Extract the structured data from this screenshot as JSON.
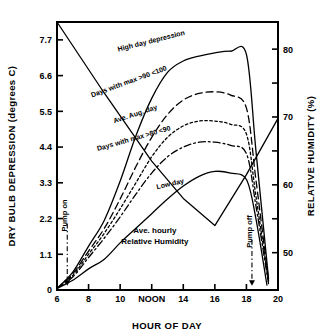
{
  "chart_data": {
    "type": "line",
    "title": "",
    "xlabel": "HOUR OF DAY",
    "ylabel": "DRY BULB DEPRESSION (degrees C)",
    "y2label": "RELATIVE HUMIDITY (%)",
    "xlim": [
      6,
      20
    ],
    "ylim": [
      0,
      8.25
    ],
    "y2lim": [
      44.5,
      84.0
    ],
    "grid": false,
    "legend_position": "inline-curve-labels",
    "xticks": [
      6,
      8,
      10,
      12,
      14,
      16,
      18,
      20
    ],
    "xtick_labels": [
      "6",
      "8",
      "10",
      "NOON",
      "14",
      "16",
      "18",
      "20"
    ],
    "yticks": [
      0,
      1.1,
      2.2,
      3.3,
      4.4,
      5.5,
      6.6,
      7.7
    ],
    "ytick_labels": [
      "0",
      "1.1",
      "2.2",
      "3.3",
      "4.4",
      "5.5",
      "6.6",
      "7.7"
    ],
    "y2ticks": [
      50,
      55,
      60,
      65,
      70,
      75,
      80
    ],
    "y2tick_labels": [
      "50",
      "",
      "60",
      "",
      "70",
      "",
      "80"
    ],
    "series": [
      {
        "name": "High day depression",
        "style": "solid",
        "axis": "left",
        "x": [
          6,
          7,
          8,
          9,
          10,
          11,
          12,
          13,
          14,
          15,
          16,
          17,
          18,
          18.6,
          19.4
        ],
        "y": [
          0.05,
          0.55,
          1.35,
          2.15,
          3.35,
          4.75,
          5.9,
          6.7,
          7.05,
          7.2,
          7.3,
          7.35,
          7.25,
          4.3,
          0.35
        ]
      },
      {
        "name": "Days with max >90 <100",
        "style": "dashed",
        "axis": "left",
        "x": [
          6,
          7,
          8,
          9,
          10,
          11,
          12,
          13,
          14,
          15,
          16,
          17,
          18,
          18.6,
          19.4
        ],
        "y": [
          0.05,
          0.5,
          1.2,
          1.9,
          2.8,
          3.8,
          4.7,
          5.4,
          5.85,
          6.05,
          6.1,
          6.0,
          5.6,
          3.4,
          0.3
        ]
      },
      {
        "name": "Ave. Aug. day",
        "style": "dotted",
        "axis": "left",
        "x": [
          6,
          7,
          8,
          9,
          10,
          11,
          12,
          13,
          14,
          15,
          16,
          17,
          18,
          18.6,
          19.4
        ],
        "y": [
          0.05,
          0.45,
          1.1,
          1.75,
          2.5,
          3.3,
          4.1,
          4.7,
          5.05,
          5.2,
          5.2,
          5.1,
          4.8,
          2.9,
          0.25
        ]
      },
      {
        "name": "Days with max >80 <90",
        "style": "dashdot",
        "axis": "left",
        "x": [
          6,
          7,
          8,
          9,
          10,
          11,
          12,
          13,
          14,
          15,
          16,
          17,
          18,
          18.6,
          19.4
        ],
        "y": [
          0.05,
          0.4,
          1.0,
          1.6,
          2.25,
          2.95,
          3.6,
          4.1,
          4.4,
          4.55,
          4.55,
          4.45,
          4.2,
          2.6,
          0.2
        ]
      },
      {
        "name": "Low day",
        "style": "solid",
        "axis": "left",
        "x": [
          6,
          7,
          8,
          9,
          10,
          11,
          12,
          13,
          14,
          15,
          16,
          17,
          18,
          18.6,
          19.3
        ],
        "y": [
          0.05,
          0.3,
          0.65,
          0.95,
          1.45,
          1.9,
          2.35,
          2.8,
          3.2,
          3.5,
          3.65,
          3.6,
          3.4,
          2.2,
          0.15
        ]
      },
      {
        "name": "Ave. hourly Relative Humidity",
        "style": "solid",
        "axis": "right",
        "x": [
          6,
          9,
          12,
          14,
          16,
          18,
          20
        ],
        "y": [
          84.0,
          73.5,
          63.5,
          58.0,
          54.0,
          61.5,
          69.8
        ]
      }
    ],
    "annotations": [
      {
        "text": "High day depression",
        "x": 12.0,
        "y": 7.6,
        "rotation": -14
      },
      {
        "text": "Days with max >90 <100",
        "x": 10.6,
        "y": 6.35,
        "rotation": -20
      },
      {
        "text": "Ave. Aug. day",
        "x": 11.0,
        "y": 5.35,
        "rotation": -18
      },
      {
        "text": "Days with max >80 <90",
        "x": 10.9,
        "y": 4.6,
        "rotation": -16
      },
      {
        "text": "Low day",
        "x": 13.2,
        "y": 3.2,
        "rotation": -13
      },
      {
        "text": "Ave. hourly",
        "x": 12.2,
        "y": 1.75,
        "rotation": 0
      },
      {
        "text": "Relative Humidity",
        "x": 12.2,
        "y": 1.42,
        "rotation": 0
      },
      {
        "text": "Pump on",
        "x": 6.65,
        "y": 1.8,
        "rotation": -90
      },
      {
        "text": "Pump off",
        "x": 18.35,
        "y": 1.3,
        "rotation": -90
      }
    ],
    "markers": [
      {
        "name": "pump-on-arrow",
        "x": 6.65,
        "label": "Pump on"
      },
      {
        "name": "pump-off-arrow",
        "x": 18.35,
        "label": "Pump off"
      }
    ]
  },
  "axes": {
    "y_title": "DRY BULB DEPRESSION (degrees C)",
    "y_title_line1": "DRY  BULB  DEPRESSION  (degrees C)",
    "x_title": "HOUR OF DAY",
    "y2_title": "RELATIVE  HUMIDITY  (%)"
  }
}
